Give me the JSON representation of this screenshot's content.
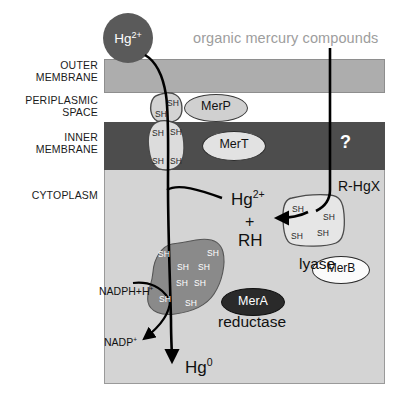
{
  "diagram": {
    "title_text": "organic mercury compounds",
    "compartments": [
      {
        "key": "outer_membrane",
        "label": "OUTER\nMEMBRANE"
      },
      {
        "key": "periplasmic_space",
        "label": "PERIPLASMIC\nSPACE"
      },
      {
        "key": "inner_membrane",
        "label": "INNER\nMEMBRANE"
      },
      {
        "key": "cytoplasm",
        "label": "CYTOPLASM"
      }
    ],
    "species": {
      "mercury_ion": "Hg",
      "mercury_ion_charge": "2+",
      "mercury_metal": "Hg",
      "mercury_metal_charge": "0",
      "organomercurial": "R-HgX",
      "hydrocarbon": "RH",
      "plus": "+",
      "nadph": "NADPH+H",
      "nadph_charge": "+",
      "nadp": "NADP",
      "nadp_charge": "+",
      "unknown_transporter": "?"
    },
    "proteins": [
      {
        "key": "merp",
        "label": "MerP",
        "role": ""
      },
      {
        "key": "mert",
        "label": "MerT",
        "role": ""
      },
      {
        "key": "mera",
        "label": "MerA",
        "role": "reductase"
      },
      {
        "key": "merb",
        "label": "MerB",
        "role": "lyase"
      }
    ],
    "role_labels": {
      "mera_role": "reductase",
      "merb_role": "lyase"
    },
    "thiol_label": "SH",
    "thiol_counts": {
      "merp_protein": 2,
      "mert_protein": 4,
      "mera_protein": 8,
      "merb_protein": 4
    },
    "colors": {
      "outer_membrane": "#adadad",
      "inner_membrane": "#4d4d4d",
      "cytoplasm": "#d4d4d4",
      "periplasm": "#ffffff",
      "mercury_circle": "#5a5a5a",
      "mera_blob": "#8a8a8a",
      "merb_blob": "#e0e0e0",
      "title_text": "#9d9d9d",
      "arrow": "#000000"
    }
  }
}
